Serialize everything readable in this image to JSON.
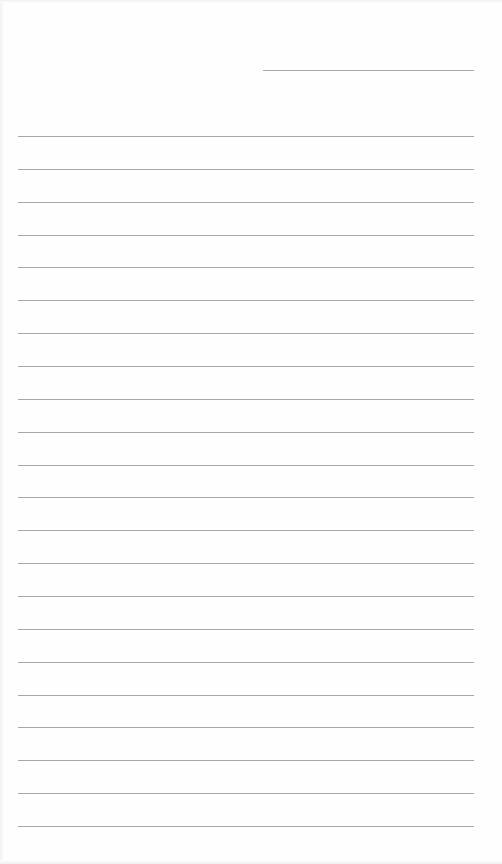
{
  "page": {
    "type": "lined-paper",
    "background_color": "#ffffff",
    "line_color": "#a9a9a9",
    "header_line": {
      "label": "",
      "x": 263,
      "y": 70,
      "width": 211
    },
    "ruled_lines": {
      "count": 22,
      "first_y": 136,
      "spacing": 32.86,
      "x": 18,
      "width": 456
    },
    "written_content": []
  }
}
